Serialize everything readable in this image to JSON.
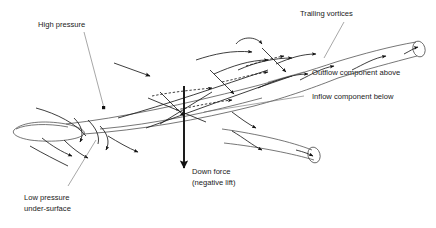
{
  "diagram": {
    "background_color": "#ffffff",
    "line_color": "#1c1c1c",
    "body_line_color": "#4a4a4a",
    "leader_color": "#6b6b6b",
    "text_color": "#1a1a1a",
    "width": 436,
    "height": 228
  },
  "labels": {
    "high_pressure": "High pressure",
    "trailing_vortices": "Trailing vortices",
    "outflow_component": "Outflow component above",
    "inflow_component": "Inflow component below",
    "down_force_line1": "Down force",
    "down_force_line2": "(negative lift)",
    "low_pressure_line1": "Low pressure",
    "low_pressure_line2": "under-surface"
  }
}
